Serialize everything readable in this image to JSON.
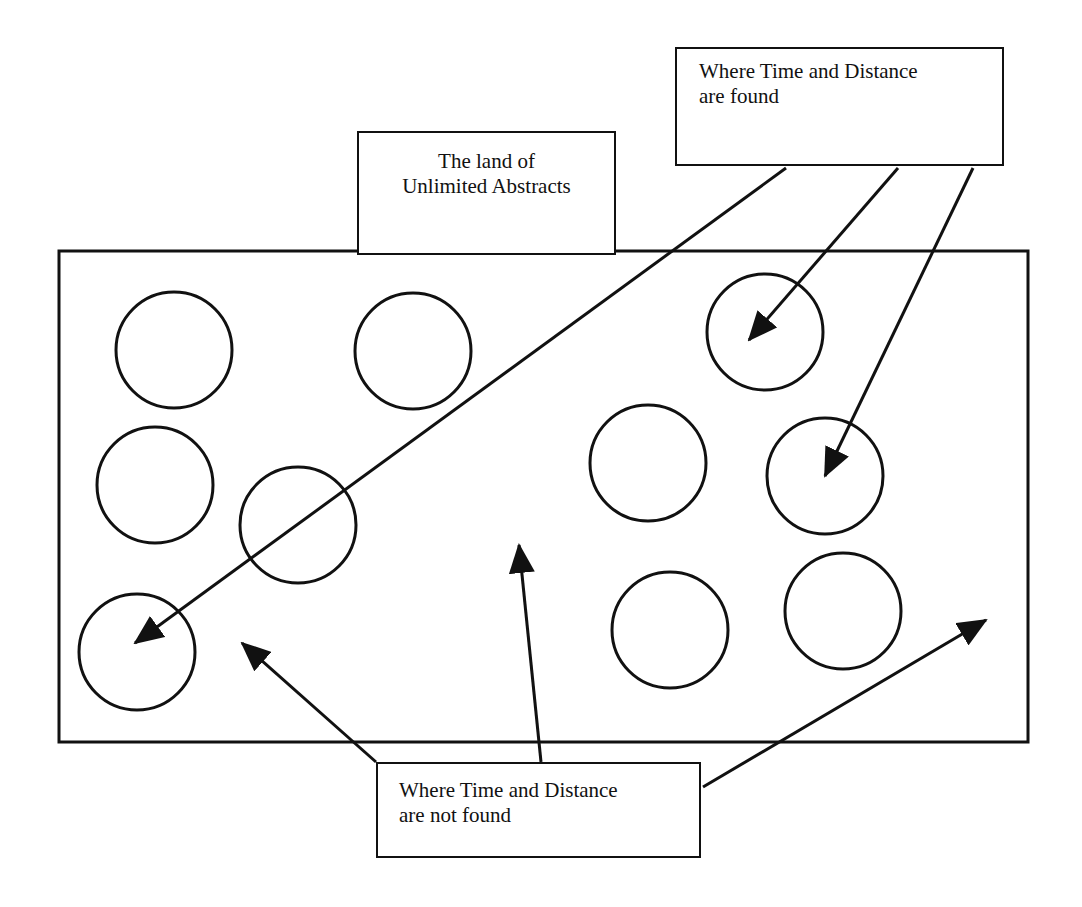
{
  "diagram": {
    "type": "concept-diagram",
    "stroke_color": "#111111",
    "background_color": "#ffffff",
    "labels": {
      "land": {
        "line1": "The land of",
        "line2": "Unlimited Abstracts"
      },
      "found": {
        "line1": "Where Time and Distance",
        "line2": "are found"
      },
      "not_found": {
        "line1": "Where Time and Distance",
        "line2": "are not found"
      }
    },
    "region": {
      "name": "Unlimited Abstracts region",
      "circle_count": 10
    },
    "arrows": {
      "from_found": 3,
      "from_not_found": 3
    }
  }
}
